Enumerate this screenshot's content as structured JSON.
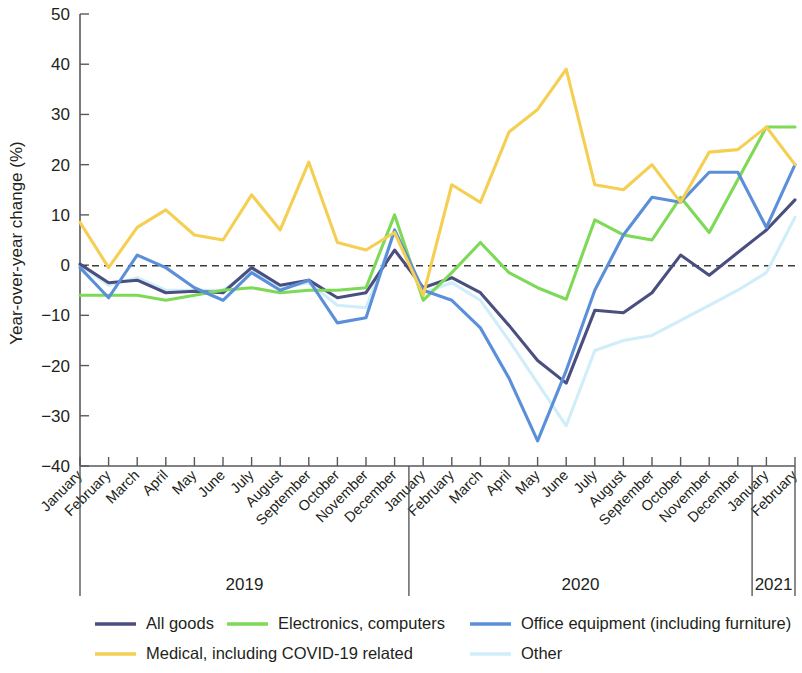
{
  "chart_data": {
    "type": "line",
    "title": "",
    "xlabel": "",
    "ylabel": "Year-over-year change (%)",
    "ylim": [
      -40,
      50
    ],
    "yticks": [
      50,
      40,
      30,
      20,
      10,
      0,
      -10,
      -20,
      -30,
      -40
    ],
    "ytick_labels": [
      "50",
      "40",
      "30",
      "20",
      "10",
      "0",
      "−10",
      "−20",
      "−30",
      "−40"
    ],
    "grid": false,
    "zero_reference_line": true,
    "legend_position": "bottom",
    "x": [
      "January 2019",
      "February 2019",
      "March 2019",
      "April 2019",
      "May 2019",
      "June 2019",
      "July 2019",
      "August 2019",
      "September 2019",
      "October 2019",
      "November 2019",
      "December 2019",
      "January 2020",
      "February 2020",
      "March 2020",
      "April 2020",
      "May 2020",
      "June 2020",
      "July 2020",
      "August 2020",
      "September 2020",
      "October 2020",
      "November 2020",
      "December 2020",
      "January 2021",
      "February 2021"
    ],
    "categories": [
      "January",
      "February",
      "March",
      "April",
      "May",
      "June",
      "July",
      "August",
      "September",
      "October",
      "November",
      "December",
      "January",
      "February",
      "March",
      "April",
      "May",
      "June",
      "July",
      "August",
      "September",
      "October",
      "November",
      "December",
      "January",
      "February"
    ],
    "year_groups": [
      {
        "label": "2019",
        "start_index": 0,
        "end_index": 11
      },
      {
        "label": "2020",
        "start_index": 12,
        "end_index": 23
      },
      {
        "label": "2021",
        "start_index": 24,
        "end_index": 25
      }
    ],
    "series": [
      {
        "name": "All goods",
        "color": "#4a4f7f",
        "values": [
          0.2,
          -3.5,
          -3.0,
          -5.5,
          -5.2,
          -5.5,
          -0.5,
          -4.0,
          -3.0,
          -6.5,
          -5.5,
          3.0,
          -4.5,
          -2.5,
          -5.5,
          -12.0,
          -19.0,
          -23.5,
          -9.0,
          -9.5,
          -5.5,
          2.0,
          -2.0,
          2.5,
          7.0,
          13.0
        ]
      },
      {
        "name": "Electronics, computers",
        "color": "#7ed957",
        "values": [
          -6.0,
          -6.0,
          -6.0,
          -7.0,
          -6.0,
          -5.0,
          -4.5,
          -5.5,
          -5.0,
          -5.0,
          -4.5,
          10.0,
          -7.0,
          -1.5,
          4.5,
          -1.5,
          -4.5,
          -6.8,
          9.0,
          6.0,
          5.0,
          13.5,
          6.5,
          17.0,
          27.5,
          27.5
        ]
      },
      {
        "name": "Office equipment (including furniture)",
        "color": "#5b8fd9",
        "values": [
          -0.5,
          -6.5,
          2.0,
          -0.5,
          -4.5,
          -7.0,
          -1.5,
          -5.0,
          -3.0,
          -11.5,
          -10.5,
          7.0,
          -5.0,
          -7.0,
          -12.5,
          -22.5,
          -35.0,
          -21.0,
          -5.0,
          6.0,
          13.5,
          12.5,
          18.5,
          18.5,
          7.5,
          20.0
        ]
      },
      {
        "name": "Medical, including COVID-19 related",
        "color": "#f5cf52",
        "values": [
          8.5,
          -0.5,
          7.5,
          11.0,
          6.0,
          5.0,
          14.0,
          7.0,
          20.5,
          4.5,
          3.0,
          6.5,
          -6.0,
          16.0,
          12.5,
          26.5,
          31.0,
          39.0,
          16.0,
          15.0,
          20.0,
          12.5,
          22.5,
          23.0,
          27.5,
          20.0
        ]
      },
      {
        "name": "Other",
        "color": "#cfeefa",
        "values": [
          0.0,
          -4.0,
          -2.5,
          -5.0,
          -5.0,
          -5.0,
          -1.0,
          -4.5,
          -3.5,
          -8.0,
          -8.5,
          6.5,
          -5.5,
          -3.5,
          -7.0,
          -15.0,
          -23.5,
          -32.0,
          -17.0,
          -15.0,
          -14.0,
          -11.0,
          -8.0,
          -5.0,
          -1.5,
          9.5
        ]
      }
    ]
  },
  "legend": {
    "items": [
      {
        "label": "All goods",
        "color": "#4a4f7f"
      },
      {
        "label": "Electronics, computers",
        "color": "#7ed957"
      },
      {
        "label": "Office equipment (including furniture)",
        "color": "#5b8fd9"
      },
      {
        "label": "Medical, including COVID-19 related",
        "color": "#f5cf52"
      },
      {
        "label": "Other",
        "color": "#cfeefa"
      }
    ]
  }
}
